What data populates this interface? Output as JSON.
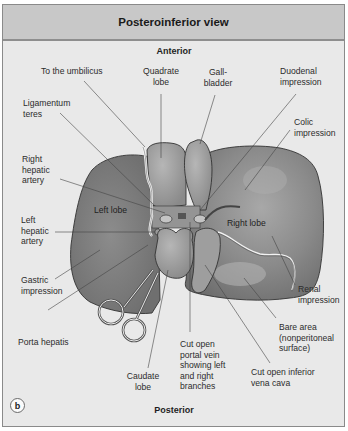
{
  "figure": {
    "title": "Posteroinferior view",
    "top_orientation": "Anterior",
    "bottom_orientation": "Posterior",
    "panel_label": "b"
  },
  "labels": {
    "to_umbilicus": "To the umbilicus",
    "quadrate_lobe_1": "Quadrate",
    "quadrate_lobe_2": "lobe",
    "gallbladder_1": "Gall-",
    "gallbladder_2": "bladder",
    "duodenal_1": "Duodenal",
    "duodenal_2": "impression",
    "ligamentum_1": "Ligamentum",
    "ligamentum_2": "teres",
    "colic_1": "Colic",
    "colic_2": "impression",
    "right_hepatic_1": "Right",
    "right_hepatic_2": "hepatic",
    "right_hepatic_3": "artery",
    "left_lobe": "Left lobe",
    "right_lobe": "Right lobe",
    "left_hepatic_1": "Left",
    "left_hepatic_2": "hepatic",
    "left_hepatic_3": "artery",
    "gastric_1": "Gastric",
    "gastric_2": "impression",
    "renal_1": "Renal",
    "renal_2": "impression",
    "porta_hepatis": "Porta hepatis",
    "bare_area_1": "Bare area",
    "bare_area_2": "(nonperitoneal",
    "bare_area_3": "surface)",
    "portal_vein_1": "Cut open",
    "portal_vein_2": "portal vein",
    "portal_vein_3": "showing left",
    "portal_vein_4": "and right",
    "portal_vein_5": "branches",
    "caudate_1": "Caudate",
    "caudate_2": "lobe",
    "ivc_1": "Cut open inferior",
    "ivc_2": "vena cava"
  },
  "colors": {
    "header_bg": "#c8c8c8",
    "panel_bg": "#e9e9e9",
    "liver_dark": "#7d7d7d",
    "liver_light": "#a6a6a6",
    "leader_line": "#444444"
  }
}
